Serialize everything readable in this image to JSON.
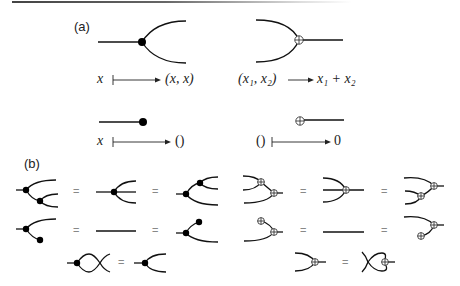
{
  "panels": {
    "a": {
      "label": "(a)",
      "copy": {
        "domain": "x",
        "codomain": "(x, x)",
        "arrow": "maps-to"
      },
      "add": {
        "domain": "(x₁, x₂)",
        "codomain": "x₁ + x₂",
        "arrow": "to"
      },
      "delete": {
        "domain": "x",
        "codomain": "()",
        "arrow": "maps-to"
      },
      "zero": {
        "domain": "()",
        "codomain": "0",
        "arrow": "maps-to"
      }
    },
    "b": {
      "label": "(b)",
      "equals": "=",
      "rows": [
        {
          "name": "associativity",
          "left_group": "copy",
          "right_group": "add"
        },
        {
          "name": "unitality",
          "left_group": "copy-delete",
          "right_group": "add-zero"
        },
        {
          "name": "commutativity",
          "left_group": "copy-swap",
          "right_group": "add-swap"
        }
      ]
    }
  }
}
